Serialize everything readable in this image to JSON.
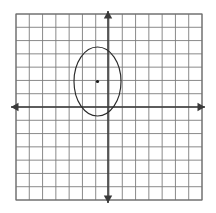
{
  "figure": {
    "background_color": "#ffffff"
  },
  "grid": {
    "label": "graph-grid",
    "x_min": 16,
    "y_min": 14,
    "x_max": 202,
    "y_max": 200,
    "columns": 14,
    "rows": 14,
    "cell_size": 13.2857,
    "line_color": "#7d7d7d",
    "line_width": 0.9,
    "border_color": "#6e6e6e",
    "border_width": 1.1
  },
  "axes": {
    "label": "coordinate-axes",
    "color": "#3a3a3a",
    "line_width": 1.6,
    "origin_x": 108,
    "origin_y": 107,
    "x_axis": {
      "label": "x-axis",
      "start_x": 11,
      "end_x": 205,
      "y": 107,
      "arrow_left": true,
      "arrow_right": true
    },
    "y_axis": {
      "label": "y-axis",
      "x": 108,
      "start_y": 11,
      "end_y": 203,
      "arrow_up": true,
      "arrow_down": true
    },
    "arrow_half_width": 4.2,
    "arrow_length": 7.5
  },
  "ellipse": {
    "label": "ellipse-shape",
    "center_x": 97.5,
    "center_y": 81.5,
    "radius_x": 23.5,
    "radius_y": 34.5,
    "stroke_color": "#2b2b2b",
    "stroke_width": 1.15,
    "fill": "none"
  },
  "center_point": {
    "label": "ellipse-center-point",
    "x": 97.5,
    "y": 81.5,
    "radius": 1.6,
    "color": "#1a1a1a"
  },
  "chart_data": {
    "type": "scatter",
    "xlabel": "",
    "ylabel": "",
    "grid": true,
    "legend": "none",
    "xlim": [
      -7,
      7
    ],
    "ylim": [
      -7,
      7
    ],
    "annotations": [
      "ellipse centered left of the y-axis and above the x-axis",
      "center marked with a dot"
    ],
    "series": [
      {
        "name": "ellipse",
        "shape": "ellipse",
        "center": [
          -0.79,
          1.92
        ],
        "semi_axis_x": 1.77,
        "semi_axis_y": 2.6
      },
      {
        "name": "center",
        "shape": "point",
        "x": [
          -0.79
        ],
        "y": [
          1.92
        ]
      }
    ]
  }
}
